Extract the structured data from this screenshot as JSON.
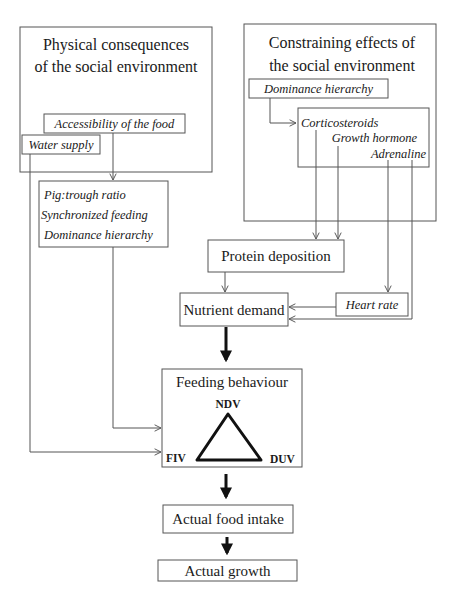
{
  "diagram": {
    "physical": {
      "title_line1": "Physical consequences",
      "title_line2": "of the social environment",
      "accessibility": "Accessibility of the food",
      "water_supply": "Water supply"
    },
    "constraining": {
      "title_line1": "Constraining effects of",
      "title_line2": "the social environment",
      "dominance_hierarchy": "Dominance hierarchy",
      "hormones": [
        "Corticosteroids",
        "Growth hormone",
        "Adrenaline"
      ]
    },
    "pig_factors": [
      "Pig:trough ratio",
      "Synchronized feeding",
      "Dominance hierarchy"
    ],
    "protein_deposition": "Protein deposition",
    "nutrient_demand": "Nutrient demand",
    "heart_rate": "Heart rate",
    "feeding_behaviour": {
      "title": "Feeding behaviour",
      "vertex_top": "NDV",
      "vertex_left": "FIV",
      "vertex_right": "DUV"
    },
    "actual_food_intake": "Actual food intake",
    "actual_growth": "Actual growth"
  }
}
